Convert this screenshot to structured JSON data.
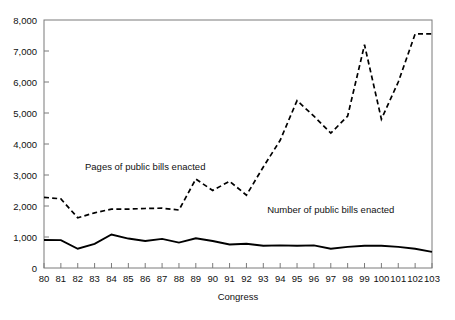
{
  "chart_data": {
    "type": "line",
    "title": "",
    "xlabel": "Congress",
    "ylabel": "",
    "categories": [
      "80",
      "81",
      "82",
      "83",
      "84",
      "85",
      "86",
      "87",
      "88",
      "89",
      "90",
      "91",
      "92",
      "93",
      "94",
      "95",
      "96",
      "97",
      "98",
      "99",
      "100",
      "101",
      "102",
      "103"
    ],
    "ylim": [
      0,
      8000
    ],
    "ytick_values": [
      0,
      1000,
      2000,
      3000,
      4000,
      5000,
      6000,
      7000,
      8000
    ],
    "ytick_labels": [
      "0",
      "1,000",
      "2,000",
      "3,000",
      "4,000",
      "5,000",
      "6,000",
      "7,000",
      "8,000"
    ],
    "grid": false,
    "legend_position": "inline-annotation",
    "series": [
      {
        "name": "Pages of public bills enacted",
        "style": "dashed",
        "color": "#000000",
        "values": [
          2280,
          2230,
          1620,
          1780,
          1900,
          1900,
          1920,
          1930,
          1870,
          2870,
          2500,
          2800,
          2350,
          3260,
          4120,
          5400,
          4900,
          4350,
          4900,
          7200,
          4800,
          6000,
          7550,
          7550
        ]
      },
      {
        "name": "Number of public bills enacted",
        "style": "solid",
        "color": "#000000",
        "values": [
          905,
          900,
          620,
          780,
          1080,
          950,
          870,
          940,
          820,
          960,
          870,
          760,
          780,
          720,
          730,
          720,
          730,
          620,
          680,
          720,
          720,
          680,
          620,
          520
        ]
      }
    ],
    "annotations": [
      {
        "text": "Pages of public bills enacted",
        "x_category": "86",
        "y_value": 3150
      },
      {
        "text": "Number of public bills enacted",
        "x_category": "97",
        "y_value": 1760
      }
    ]
  },
  "footer": {
    "source_note": ""
  }
}
